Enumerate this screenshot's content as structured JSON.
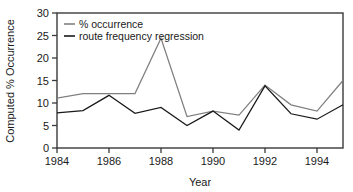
{
  "chart_data": {
    "type": "line",
    "title": "",
    "xlabel": "Year",
    "ylabel": "Computed % Occurrence",
    "xlim": [
      1984,
      1995
    ],
    "ylim": [
      0,
      30
    ],
    "grid": false,
    "legend_position": "top-left",
    "x": [
      1984,
      1985,
      1986,
      1987,
      1988,
      1989,
      1990,
      1991,
      1992,
      1993,
      1994,
      1995
    ],
    "xticks": [
      1984,
      1986,
      1988,
      1990,
      1992,
      1994
    ],
    "xticklabels": [
      "1984",
      "1986",
      "1988",
      "1990",
      "1992",
      "1994"
    ],
    "yticks": [
      0,
      5,
      10,
      15,
      20,
      25,
      30
    ],
    "yticklabels": [
      "0",
      "5",
      "10",
      "15",
      "20",
      "25",
      "30"
    ],
    "series": [
      {
        "name": "% occurrence",
        "color": "#808080",
        "values": [
          11.1,
          12.1,
          12.1,
          12.1,
          24.4,
          7.0,
          8.2,
          7.3,
          14.0,
          9.6,
          8.2,
          15.0
        ]
      },
      {
        "name": "route frequency regression",
        "color": "#1a1a1a",
        "values": [
          7.8,
          8.3,
          11.7,
          7.7,
          9.0,
          5.0,
          8.2,
          4.0,
          13.8,
          7.6,
          6.4,
          9.6
        ]
      }
    ]
  },
  "legend": {
    "items": [
      {
        "label": "% occurrence",
        "color": "#808080"
      },
      {
        "label": "route frequency regression",
        "color": "#1a1a1a"
      }
    ]
  },
  "axes": {
    "y_title": "Computed % Occurrence",
    "x_title": "Year"
  }
}
